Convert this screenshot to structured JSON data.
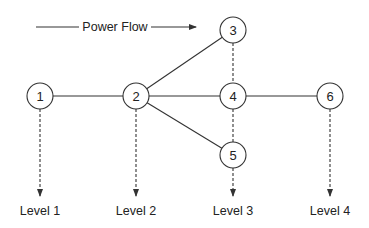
{
  "title": "Power Flow",
  "power_flow": {
    "label": "Power Flow",
    "x1": 36,
    "x2": 196,
    "y": 27,
    "text_x": 115
  },
  "nodes": [
    {
      "id": "1",
      "label": "1",
      "x": 40,
      "y": 96
    },
    {
      "id": "2",
      "label": "2",
      "x": 136,
      "y": 96
    },
    {
      "id": "3",
      "label": "3",
      "x": 233,
      "y": 30
    },
    {
      "id": "4",
      "label": "4",
      "x": 233,
      "y": 96
    },
    {
      "id": "5",
      "label": "5",
      "x": 233,
      "y": 155
    },
    {
      "id": "6",
      "label": "6",
      "x": 330,
      "y": 96
    }
  ],
  "edges": [
    {
      "from": "1",
      "to": "2",
      "style": "solid"
    },
    {
      "from": "2",
      "to": "3",
      "style": "solid"
    },
    {
      "from": "2",
      "to": "4",
      "style": "solid"
    },
    {
      "from": "2",
      "to": "5",
      "style": "solid"
    },
    {
      "from": "4",
      "to": "6",
      "style": "solid"
    },
    {
      "from": "3",
      "to": "4",
      "style": "dashed"
    },
    {
      "from": "4",
      "to": "5",
      "style": "dashed"
    }
  ],
  "levels": [
    {
      "label": "Level 1",
      "x": 40,
      "from_y": 109
    },
    {
      "label": "Level 2",
      "x": 136,
      "from_y": 109
    },
    {
      "label": "Level 3",
      "x": 233,
      "from_y": 168
    },
    {
      "label": "Level 4",
      "x": 330,
      "from_y": 109
    }
  ],
  "node_radius": 13,
  "arrow_end_y": 196,
  "level_label_y": 215
}
